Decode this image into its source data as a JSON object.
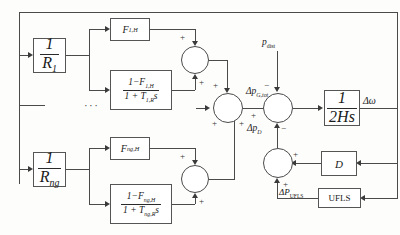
{
  "diagram": {
    "blocks": {
      "droop_1": {
        "num": "1",
        "den": "R",
        "den_sub": "1"
      },
      "droop_n": {
        "num": "1",
        "den": "R",
        "den_sub": "ng"
      },
      "fh_1": {
        "label": "F",
        "sub": "1,H"
      },
      "fh_n": {
        "label": "F",
        "sub": "ng,H"
      },
      "lag_1": {
        "num_pre": "1−F",
        "num_sub": "1,H",
        "den_pre": "1 + T",
        "den_sub": "1,R",
        "den_post": "s"
      },
      "lag_n": {
        "num_pre": "1−F",
        "num_sub": "ng,H",
        "den_pre": "1 + T",
        "den_sub": "ng,R",
        "den_post": "s"
      },
      "inertia": {
        "num": "1",
        "den": "2Hs"
      },
      "damping": {
        "label": "D"
      },
      "ufls": {
        "label": "UFLS"
      }
    },
    "signals": {
      "p_dist": {
        "base": "p",
        "sub": "dist"
      },
      "dp_gtot": {
        "base": "Δp",
        "sub": "G,tot"
      },
      "dp_d": {
        "base": "Δp",
        "sub": "D"
      },
      "dp_ufls": {
        "base": "ΔP",
        "sub": "UFLS"
      },
      "d_omega": "Δω",
      "ellipsis": "···"
    },
    "signs": {
      "plus": "+",
      "minus": "−"
    },
    "colors": {
      "wire": "#4a4a4a",
      "box_border": "#555555",
      "text": "#1a1a1a",
      "background": "#fdfdfc"
    }
  }
}
